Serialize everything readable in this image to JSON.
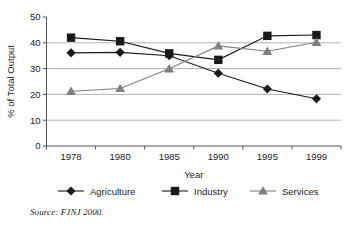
{
  "chart_data": {
    "type": "line",
    "title": "",
    "xlabel": "Year",
    "ylabel": "% of Total Output",
    "categories": [
      "1978",
      "1980",
      "1985",
      "1990",
      "1995",
      "1999"
    ],
    "ylim": [
      0,
      50
    ],
    "yticks": [
      0,
      10,
      20,
      30,
      40,
      50
    ],
    "ytick_labels": [
      "0",
      "10",
      "20",
      "30",
      "40",
      "50"
    ],
    "grid": "horizontal",
    "legend_position": "bottom",
    "series": [
      {
        "name": "Agriculture",
        "marker": "diamond",
        "color": "#1a1a1a",
        "values": [
          36.1,
          36.3,
          35.0,
          28.2,
          22.1,
          18.3
        ]
      },
      {
        "name": "Industry",
        "marker": "square",
        "color": "#1a1a1a",
        "values": [
          42.0,
          40.6,
          35.9,
          33.4,
          42.7,
          43.0
        ]
      },
      {
        "name": "Services",
        "marker": "triangle",
        "color": "#808080",
        "values": [
          21.2,
          22.3,
          29.9,
          38.8,
          36.7,
          40.2
        ]
      }
    ]
  },
  "source": {
    "label": "Source:",
    "text": "FJNJ 2000."
  },
  "colors": {
    "agriculture": "#1a1a1a",
    "industry": "#1a1a1a",
    "services": "#808080",
    "gridline": "#a8a8a8",
    "axis": "#555555",
    "background": "#ffffff"
  }
}
